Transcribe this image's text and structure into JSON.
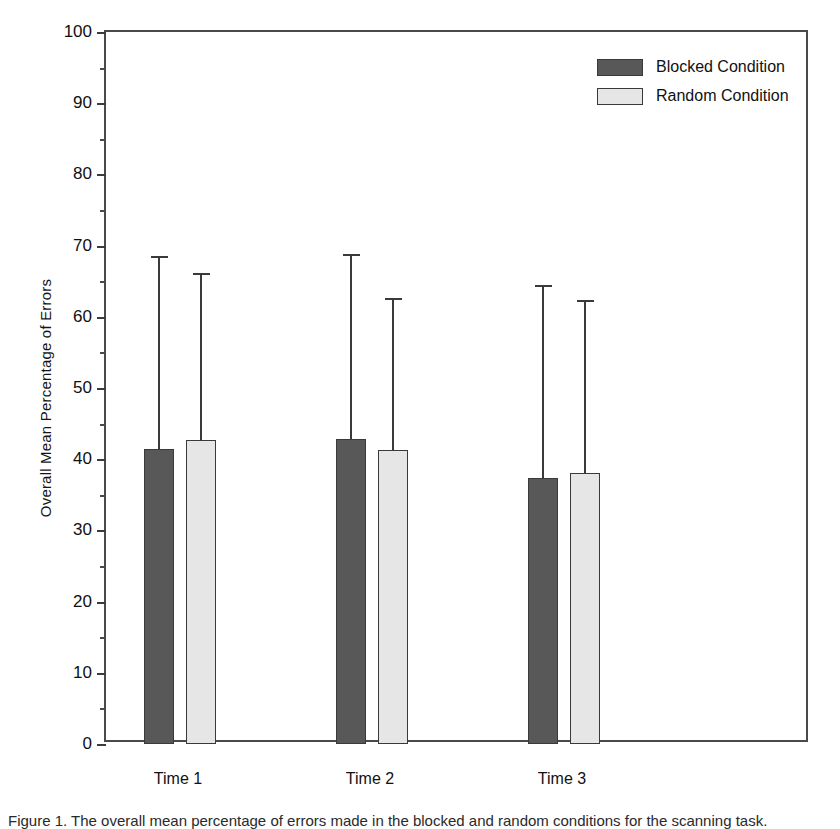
{
  "chart_data": {
    "type": "bar",
    "title": "",
    "xlabel": "",
    "ylabel": "Overall Mean Percentage of Errors",
    "categories": [
      "Time 1",
      "Time 2",
      "Time 3"
    ],
    "ylim": [
      0,
      100
    ],
    "ytick_step": 10,
    "yminor_step": 5,
    "ytick_labels": [
      "0",
      "10",
      "20",
      "30",
      "40",
      "50",
      "60",
      "70",
      "80",
      "90",
      "100"
    ],
    "grid": false,
    "legend_position": "top-right",
    "errorbars": "upper-only",
    "series": [
      {
        "name": "Blocked Condition",
        "color": "#585858",
        "values": [
          41.5,
          42.8,
          37.4
        ],
        "error_upper": [
          68.6,
          68.8,
          64.4
        ]
      },
      {
        "name": "Random Condition",
        "color": "#e6e6e6",
        "values": [
          42.7,
          41.3,
          38.1
        ],
        "error_upper": [
          66.2,
          62.7,
          62.3
        ]
      }
    ]
  },
  "legend": {
    "items": [
      {
        "label": "Blocked Condition",
        "swatch": "dark"
      },
      {
        "label": "Random Condition",
        "swatch": "light"
      }
    ]
  },
  "caption": {
    "text": "Figure 1. The overall mean percentage of errors made in the blocked and random conditions for the scanning task."
  }
}
